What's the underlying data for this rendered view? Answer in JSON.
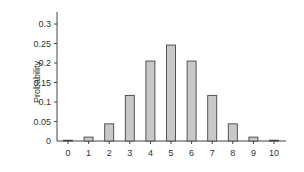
{
  "chart_data": {
    "type": "bar",
    "title": "",
    "xlabel": "",
    "ylabel": "Probability",
    "categories": [
      "0",
      "1",
      "2",
      "3",
      "4",
      "5",
      "6",
      "7",
      "8",
      "9",
      "10"
    ],
    "values": [
      0.001,
      0.01,
      0.044,
      0.117,
      0.205,
      0.246,
      0.205,
      0.117,
      0.044,
      0.01,
      0.001
    ],
    "ylim": [
      0,
      0.33
    ],
    "yticks": [
      "0",
      "0.05",
      "0.1",
      "0.15",
      "0.2",
      "0.25",
      "0.3"
    ],
    "ytick_values": [
      0,
      0.05,
      0.1,
      0.15,
      0.2,
      0.25,
      0.3
    ],
    "grid": false,
    "legend": null
  },
  "colors": {
    "bar_fill": "#c8c8c8",
    "bar_stroke": "#444444",
    "axis": "#444444",
    "text": "#333333"
  }
}
